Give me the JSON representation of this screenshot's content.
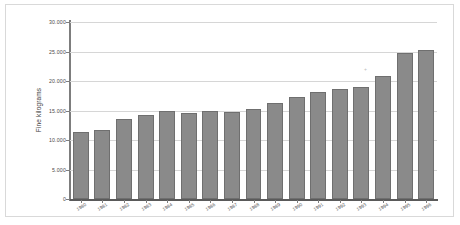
{
  "chart_data": {
    "type": "bar",
    "title": "",
    "xlabel": "",
    "ylabel": "Fine kilograms",
    "ylim": [
      0,
      30000
    ],
    "yticks": [
      0,
      5000,
      10000,
      15000,
      20000,
      25000,
      30000
    ],
    "ytick_labels": [
      "0",
      "5.000",
      "10.000",
      "15.000",
      "20.000",
      "25.000",
      "30.000"
    ],
    "grid": true,
    "legend": "none",
    "bar_color": "#8a8a8a",
    "categories": [
      "1980",
      "1981",
      "1982",
      "1983",
      "1984",
      "1985",
      "1986",
      "1987",
      "1988",
      "1989",
      "1990",
      "1991",
      "1992",
      "1993",
      "1994",
      "1995",
      "1996"
    ],
    "values": [
      11300,
      11700,
      13500,
      14200,
      15000,
      14600,
      15000,
      14700,
      15200,
      16300,
      17300,
      18200,
      18600,
      19000,
      20900,
      24800,
      25200
    ]
  },
  "figure": {
    "background": "#ffffff",
    "frame_color": "#d9d9d9",
    "grid_color": "#d6d6d6",
    "axis_color": "#7d7d7d"
  },
  "artifact": {
    "glyph": "+"
  }
}
